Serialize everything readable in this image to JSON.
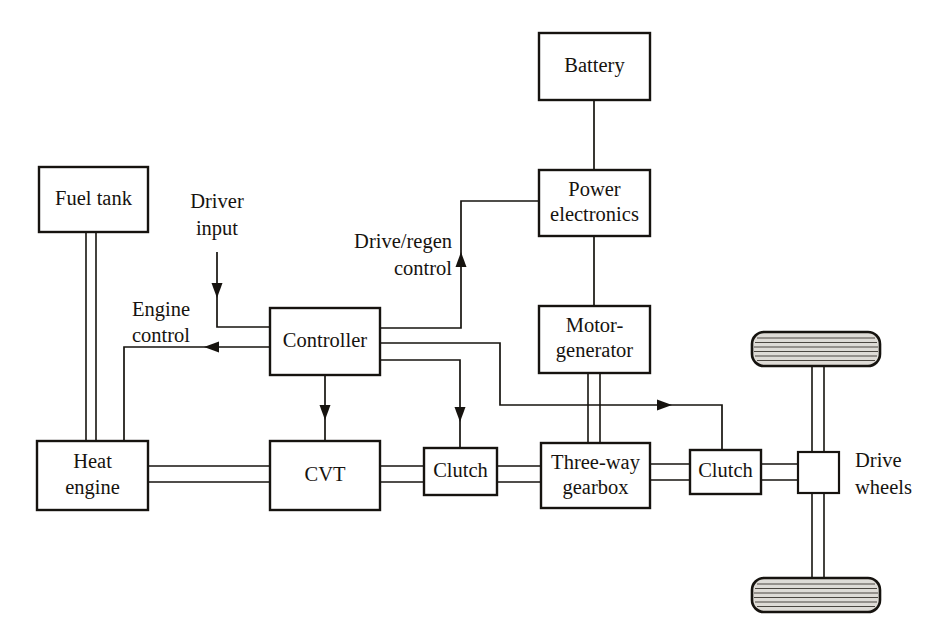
{
  "diagram": {
    "stroke_color": "#16130f",
    "background_color": "#ffffff",
    "tire_fill_color": "#dedbd6",
    "blocks": [
      {
        "id": "battery",
        "label": "Battery",
        "x": 539,
        "y": 33,
        "w": 111,
        "h": 67
      },
      {
        "id": "power-electronics",
        "label_line1": "Power",
        "label_line2": "electronics",
        "x": 539,
        "y": 170,
        "w": 111,
        "h": 66
      },
      {
        "id": "motor-generator",
        "label_line1": "Motor-",
        "label_line2": "generator",
        "x": 539,
        "y": 306,
        "w": 111,
        "h": 67
      },
      {
        "id": "fuel-tank",
        "label": "Fuel tank",
        "x": 39,
        "y": 167,
        "w": 109,
        "h": 65
      },
      {
        "id": "controller",
        "label": "Controller",
        "x": 270,
        "y": 308,
        "w": 110,
        "h": 67
      },
      {
        "id": "heat-engine",
        "label_line1": "Heat",
        "label_line2": "engine",
        "x": 37,
        "y": 441,
        "w": 111,
        "h": 69
      },
      {
        "id": "cvt",
        "label": "CVT",
        "x": 270,
        "y": 441,
        "w": 110,
        "h": 69
      },
      {
        "id": "clutch-left",
        "label": "Clutch",
        "x": 424,
        "y": 448,
        "w": 73,
        "h": 47
      },
      {
        "id": "three-way-gearbox",
        "label_line1": "Three-way",
        "label_line2": "gearbox",
        "x": 541,
        "y": 443,
        "w": 109,
        "h": 65
      },
      {
        "id": "clutch-right",
        "label": "Clutch",
        "x": 690,
        "y": 450,
        "w": 71,
        "h": 44
      },
      {
        "id": "differential",
        "label": "",
        "x": 798,
        "y": 452,
        "w": 41,
        "h": 41
      }
    ],
    "free_labels": [
      {
        "id": "driver-input",
        "line1": "Driver",
        "line2": "input",
        "x": 217,
        "y": 212,
        "anchor": "middle"
      },
      {
        "id": "drive-regen-control",
        "line1": "Drive/regen",
        "line2": "control",
        "x": 455,
        "y": 240,
        "anchor": "end"
      },
      {
        "id": "engine-control",
        "line1": "Engine",
        "line2": "control",
        "x": 160,
        "y": 311,
        "anchor": "middle"
      },
      {
        "id": "drive-wheels",
        "line1": "Drive",
        "line2": "wheels",
        "x": 855,
        "y": 463,
        "anchor": "start"
      }
    ],
    "wheels": [
      {
        "id": "wheel-top",
        "x": 752,
        "y": 332,
        "w": 128,
        "h": 34,
        "tread_lines": 7
      },
      {
        "id": "wheel-bottom",
        "x": 752,
        "y": 578,
        "w": 128,
        "h": 34,
        "tread_lines": 7
      }
    ],
    "connections": [
      {
        "id": "battery-to-power-electronics",
        "kind": "signal",
        "from": "battery",
        "to": "power-electronics"
      },
      {
        "id": "power-electronics-to-motor",
        "kind": "signal",
        "from": "power-electronics",
        "to": "motor-generator"
      },
      {
        "id": "fuel-tank-to-heat-engine",
        "kind": "mechanical",
        "from": "fuel-tank",
        "to": "heat-engine"
      },
      {
        "id": "driver-input-to-controller",
        "kind": "signal",
        "from": "driver-input",
        "to": "controller",
        "arrow": "down"
      },
      {
        "id": "controller-to-heat-engine",
        "kind": "signal",
        "from": "controller",
        "to": "heat-engine",
        "arrow": "left",
        "label": "Engine control"
      },
      {
        "id": "controller-to-power-electronics",
        "kind": "signal",
        "from": "controller",
        "to": "power-electronics",
        "arrow": "up",
        "label": "Drive/regen control"
      },
      {
        "id": "controller-to-cvt",
        "kind": "signal",
        "from": "controller",
        "to": "cvt",
        "arrow": "down"
      },
      {
        "id": "controller-to-clutch-left",
        "kind": "signal",
        "from": "controller",
        "to": "clutch-left",
        "arrow": "down"
      },
      {
        "id": "controller-to-clutch-right",
        "kind": "signal",
        "from": "controller",
        "to": "clutch-right",
        "arrow": "right"
      },
      {
        "id": "heat-engine-to-cvt",
        "kind": "mechanical",
        "from": "heat-engine",
        "to": "cvt"
      },
      {
        "id": "cvt-to-clutch-left",
        "kind": "mechanical",
        "from": "cvt",
        "to": "clutch-left"
      },
      {
        "id": "clutch-left-to-gearbox",
        "kind": "mechanical",
        "from": "clutch-left",
        "to": "three-way-gearbox"
      },
      {
        "id": "motor-to-gearbox",
        "kind": "mechanical",
        "from": "motor-generator",
        "to": "three-way-gearbox"
      },
      {
        "id": "gearbox-to-clutch-right",
        "kind": "mechanical",
        "from": "three-way-gearbox",
        "to": "clutch-right"
      },
      {
        "id": "clutch-right-to-differential",
        "kind": "mechanical",
        "from": "clutch-right",
        "to": "differential"
      },
      {
        "id": "differential-to-wheel-top",
        "kind": "mechanical",
        "from": "differential",
        "to": "wheel-top"
      },
      {
        "id": "differential-to-wheel-bottom",
        "kind": "mechanical",
        "from": "differential",
        "to": "wheel-bottom"
      }
    ]
  }
}
